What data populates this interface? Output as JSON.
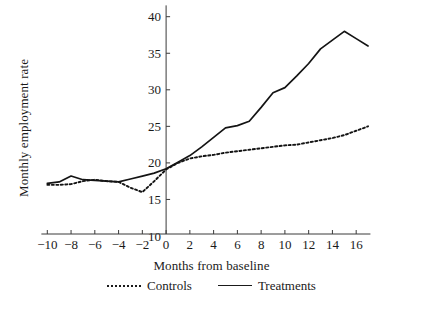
{
  "chart_data": {
    "type": "line",
    "title": "",
    "xlabel": "Months from baseline",
    "ylabel": "Monthly employment rate",
    "xlim": [
      -10.5,
      17.2
    ],
    "ylim": [
      9.0,
      41.0
    ],
    "xticks": [
      -10,
      -8,
      -6,
      -4,
      -2,
      0,
      2,
      4,
      6,
      8,
      10,
      12,
      14,
      16
    ],
    "xtick_labels": [
      "−10",
      "−8",
      "−6",
      "−4",
      "−2",
      "0",
      "2",
      "4",
      "6",
      "8",
      "10",
      "12",
      "14",
      "16"
    ],
    "yticks": [
      10,
      15,
      20,
      25,
      30,
      35,
      40
    ],
    "ytick_labels": [
      "10",
      "15",
      "20",
      "25",
      "30",
      "35",
      "40"
    ],
    "grid": false,
    "legend_position": "below",
    "x": [
      -10,
      -9,
      -8,
      -7,
      -6,
      -5,
      -4,
      -3,
      -2,
      -1,
      0,
      1,
      2,
      3,
      4,
      5,
      6,
      7,
      8,
      9,
      10,
      11,
      12,
      13,
      14,
      15,
      16,
      17
    ],
    "series": [
      {
        "name": "Controls",
        "style": "dotted",
        "color": "#141414",
        "values": [
          17.0,
          17.0,
          17.1,
          17.5,
          17.7,
          17.5,
          17.4,
          16.6,
          16.0,
          17.5,
          19.1,
          20.0,
          20.6,
          20.9,
          21.1,
          21.4,
          21.6,
          21.8,
          22.0,
          22.2,
          22.4,
          22.5,
          22.8,
          23.1,
          23.4,
          23.8,
          24.4,
          25.0
        ]
      },
      {
        "name": "Treatments",
        "style": "solid",
        "color": "#141414",
        "values": [
          17.2,
          17.4,
          18.2,
          17.7,
          17.6,
          17.5,
          17.4,
          17.8,
          18.2,
          18.6,
          19.2,
          20.1,
          21.0,
          22.2,
          23.5,
          24.8,
          25.1,
          25.7,
          27.6,
          29.6,
          30.3,
          31.9,
          33.6,
          35.6,
          36.8,
          38.0,
          37.0,
          36.0
        ]
      }
    ]
  },
  "legend": {
    "entries": [
      {
        "label": "Controls",
        "style": "dotted"
      },
      {
        "label": "Treatments",
        "style": "solid"
      }
    ]
  }
}
